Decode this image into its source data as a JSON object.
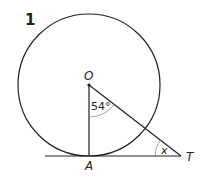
{
  "question_number": "1",
  "labels": {
    "center": "O",
    "tangent_point": "A",
    "external_point": "T",
    "angle_at_O": "54°",
    "unknown_angle": "x"
  },
  "diagram": {
    "circle": {
      "cx": 89,
      "cy": 85,
      "r": 71
    },
    "points": {
      "O": [
        89,
        85
      ],
      "A": [
        89,
        156
      ],
      "T": [
        181,
        156
      ]
    },
    "tangent_line": {
      "x1": 45,
      "x2": 181,
      "y": 156
    },
    "stroke_color": "#231f20",
    "arc_color": "#8a8a8a"
  }
}
